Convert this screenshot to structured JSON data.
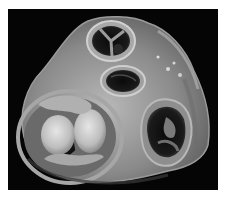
{
  "image": {
    "subject": "heart-valve-plane-specimen",
    "background_color": "#050505",
    "page_color": "#ffffff",
    "tone": "grayscale",
    "structures": [
      {
        "name": "aortic-valve-orifice",
        "position": "top-center"
      },
      {
        "name": "upper-oval-orifice",
        "position": "center"
      },
      {
        "name": "thickened-left-valve",
        "position": "lower-left"
      },
      {
        "name": "right-valve-orifice",
        "position": "right"
      }
    ]
  }
}
